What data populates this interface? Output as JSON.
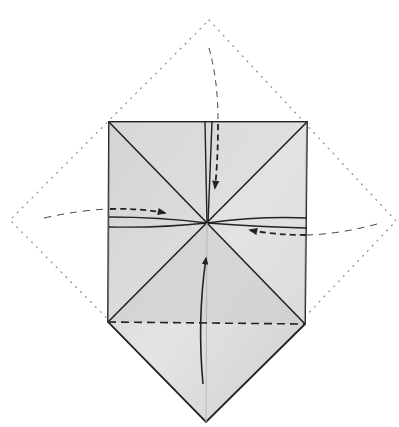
{
  "diagram": {
    "title": "Origami fold diagram",
    "width": 399,
    "height": 427,
    "colors": {
      "background": "#ffffff",
      "paper": "#d4d4d4",
      "paper_light": "#e6e6e6",
      "line": "#222222",
      "dotted": "#888888"
    },
    "outline_diamond": {
      "top": [
        209,
        20
      ],
      "right": [
        396,
        221
      ],
      "bottom": [
        207,
        420
      ],
      "left": [
        10,
        220
      ]
    },
    "paper_shape": {
      "top_left": [
        109,
        122
      ],
      "top_right": [
        307,
        122
      ],
      "bottom_right": [
        305,
        324
      ],
      "bottom_point": [
        206,
        422
      ],
      "bottom_left": [
        108,
        322
      ]
    },
    "center": [
      207,
      223
    ],
    "valley_fold": {
      "from": [
        108,
        322
      ],
      "to": [
        305,
        324
      ]
    },
    "arrows": [
      {
        "name": "arrow-from-top",
        "direction": "down"
      },
      {
        "name": "arrow-from-left",
        "direction": "right"
      },
      {
        "name": "arrow-from-right",
        "direction": "left"
      },
      {
        "name": "arrow-from-bottom",
        "direction": "up"
      }
    ]
  }
}
